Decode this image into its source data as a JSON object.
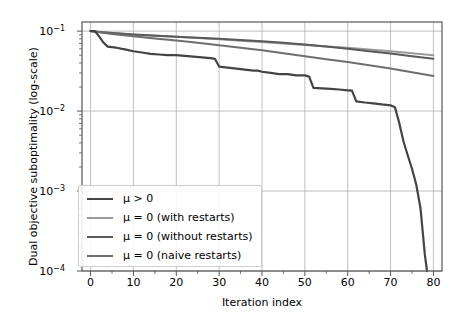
{
  "chart_data": {
    "type": "line",
    "title": "",
    "xlabel": "Iteration index",
    "ylabel": "Dual objective suboptimality (log-scale)",
    "xlim": [
      -2,
      82
    ],
    "ylim": [
      0.0001,
      0.13
    ],
    "yscale": "log",
    "grid": true,
    "legend_position": "lower left",
    "xticks": [
      0,
      10,
      20,
      30,
      40,
      50,
      60,
      70,
      80
    ],
    "xtick_labels": [
      "0",
      "10",
      "20",
      "30",
      "40",
      "50",
      "60",
      "70",
      "80"
    ],
    "yticks": [
      0.1,
      0.01,
      0.001,
      0.0001
    ],
    "ytick_labels": [
      "10⁻¹",
      "10⁻²",
      "10⁻³",
      "10⁻⁴"
    ],
    "ytick_mantissa": [
      "10",
      "10",
      "10",
      "10"
    ],
    "ytick_exponent": [
      "-1",
      "-2",
      "-3",
      "-4"
    ],
    "series": [
      {
        "name": "mu-greater-zero",
        "label_html": "μ > 0",
        "color": "#444444",
        "linewidth": 2.2,
        "x": [
          0,
          1,
          2,
          3,
          4,
          6,
          8,
          10,
          12,
          14,
          16,
          18,
          20,
          22,
          24,
          26,
          28,
          29,
          30,
          32,
          34,
          36,
          38,
          39,
          40,
          42,
          44,
          46,
          48,
          50,
          51,
          52,
          54,
          56,
          58,
          60,
          61,
          62,
          64,
          66,
          68,
          70,
          71,
          72,
          73,
          74,
          75,
          76,
          77,
          78,
          78.5
        ],
        "y": [
          0.1,
          0.1,
          0.086,
          0.072,
          0.064,
          0.062,
          0.059,
          0.056,
          0.054,
          0.052,
          0.051,
          0.05,
          0.05,
          0.049,
          0.048,
          0.047,
          0.046,
          0.045,
          0.036,
          0.035,
          0.034,
          0.033,
          0.032,
          0.032,
          0.031,
          0.03,
          0.029,
          0.029,
          0.028,
          0.028,
          0.027,
          0.0195,
          0.0192,
          0.019,
          0.0186,
          0.0182,
          0.018,
          0.0132,
          0.0128,
          0.0125,
          0.0121,
          0.0118,
          0.0112,
          0.0072,
          0.0042,
          0.0028,
          0.0019,
          0.0012,
          0.0006,
          0.00016,
          0.0001
        ]
      },
      {
        "name": "mu-zero-with-restarts",
        "label_html": "μ = 0 (with restarts)",
        "color": "#999999",
        "linewidth": 2.0,
        "x": [
          0,
          2,
          5,
          10,
          15,
          20,
          25,
          30,
          35,
          40,
          45,
          50,
          55,
          60,
          65,
          70,
          75,
          80
        ],
        "y": [
          0.1,
          0.098,
          0.095,
          0.091,
          0.088,
          0.085,
          0.082,
          0.079,
          0.076,
          0.073,
          0.07,
          0.067,
          0.064,
          0.062,
          0.059,
          0.056,
          0.053,
          0.05
        ]
      },
      {
        "name": "mu-zero-without-restarts",
        "label_html": "μ = 0 (without restarts)",
        "color": "#5a5a5a",
        "linewidth": 2.0,
        "x": [
          0,
          2,
          5,
          10,
          15,
          20,
          25,
          30,
          35,
          40,
          45,
          50,
          55,
          60,
          65,
          70,
          75,
          80
        ],
        "y": [
          0.1,
          0.0975,
          0.0945,
          0.0905,
          0.0875,
          0.085,
          0.0825,
          0.08,
          0.0775,
          0.0745,
          0.0715,
          0.068,
          0.064,
          0.06,
          0.056,
          0.0525,
          0.0485,
          0.045
        ]
      },
      {
        "name": "mu-zero-naive-restarts",
        "label_html": "μ = 0 (naive restarts)",
        "color": "#6e6e6e",
        "linewidth": 2.0,
        "x": [
          0,
          2,
          5,
          10,
          15,
          20,
          25,
          30,
          35,
          40,
          45,
          50,
          55,
          60,
          65,
          70,
          75,
          80
        ],
        "y": [
          0.1,
          0.0965,
          0.092,
          0.086,
          0.081,
          0.0765,
          0.0715,
          0.0665,
          0.062,
          0.0575,
          0.053,
          0.0485,
          0.0445,
          0.041,
          0.0375,
          0.034,
          0.0305,
          0.0275
        ]
      }
    ]
  },
  "legend": {
    "entries": [
      {
        "label": "μ > 0",
        "color": "#444444"
      },
      {
        "label": "μ = 0 (with restarts)",
        "color": "#999999"
      },
      {
        "label": "μ = 0 (without restarts)",
        "color": "#5a5a5a"
      },
      {
        "label": "μ = 0 (naive restarts)",
        "color": "#6e6e6e"
      }
    ]
  },
  "style": {
    "grid_color": "#b0b0b0",
    "spine_color": "#555555",
    "background": "#ffffff",
    "text_color": "#000000"
  }
}
